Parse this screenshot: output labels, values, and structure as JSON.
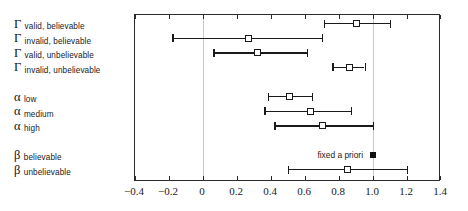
{
  "chart_data": {
    "type": "scatter",
    "title": "",
    "xlabel": "",
    "ylabel": "",
    "xlim": [
      -0.4,
      1.4
    ],
    "xticks": [
      "-0.4",
      "-0.2",
      "0",
      "0.2",
      "0.4",
      "0.6",
      "0.8",
      "1.0",
      "1.2",
      "1.4"
    ],
    "xtick_values": [
      -0.4,
      -0.2,
      0,
      0.2,
      0.4,
      0.6,
      0.8,
      1.0,
      1.2,
      1.4
    ],
    "gridlines": [
      0,
      1.0
    ],
    "grid": true,
    "legend": "none",
    "annotations": [
      {
        "text": "fixed a priori",
        "x": 1.0,
        "row": 7
      }
    ],
    "groups": [
      {
        "symbol": "Γ",
        "rows": [
          {
            "label": "valid, believable",
            "estimate": 0.9,
            "lower": 0.71,
            "upper": 1.1,
            "marker": "open-square"
          },
          {
            "label": "invalid, believable",
            "estimate": 0.27,
            "lower": -0.18,
            "upper": 0.7,
            "marker": "open-square"
          },
          {
            "label": "valid, unbelievable",
            "estimate": 0.32,
            "lower": 0.06,
            "upper": 0.61,
            "marker": "open-square"
          },
          {
            "label": "invalid, unbelievable",
            "estimate": 0.86,
            "lower": 0.76,
            "upper": 0.95,
            "marker": "open-square"
          }
        ]
      },
      {
        "symbol": "α",
        "rows": [
          {
            "label": "low",
            "estimate": 0.51,
            "lower": 0.38,
            "upper": 0.64,
            "marker": "open-square"
          },
          {
            "label": "medium",
            "estimate": 0.63,
            "lower": 0.36,
            "upper": 0.87,
            "marker": "open-square"
          },
          {
            "label": "high",
            "estimate": 0.7,
            "lower": 0.42,
            "upper": 1.0,
            "marker": "open-square"
          }
        ]
      },
      {
        "symbol": "β",
        "rows": [
          {
            "label": "believable",
            "estimate": 1.0,
            "lower": null,
            "upper": null,
            "marker": "filled-square",
            "note": "fixed a priori"
          },
          {
            "label": "unbelievable",
            "estimate": 0.85,
            "lower": 0.5,
            "upper": 1.2,
            "marker": "open-square"
          }
        ]
      }
    ]
  }
}
